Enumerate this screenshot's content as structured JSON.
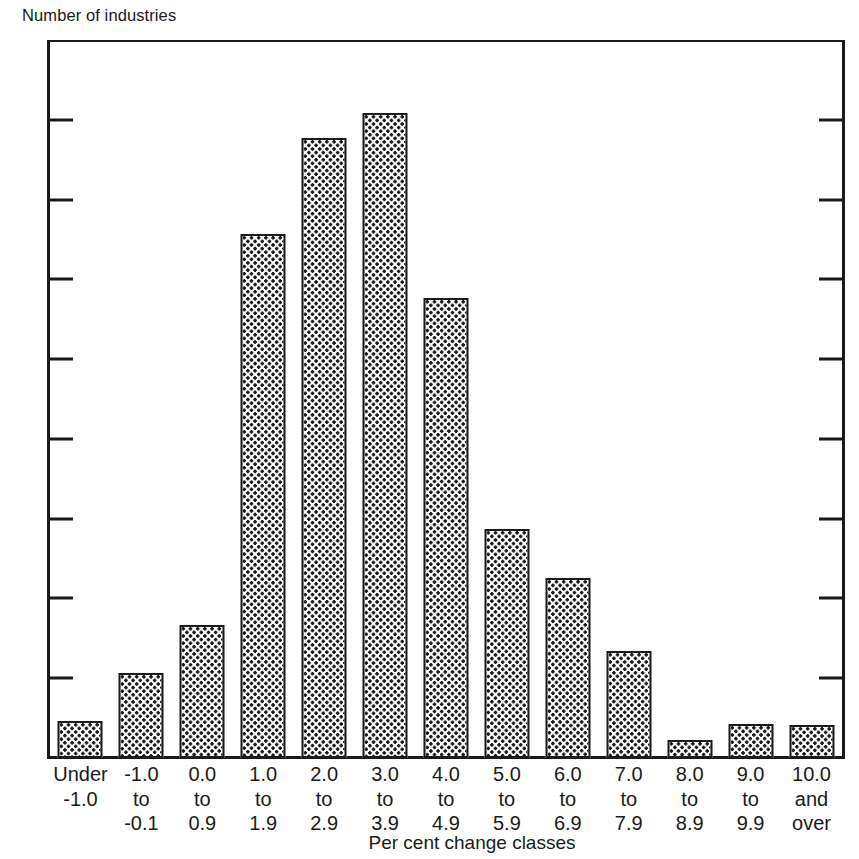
{
  "chart_data": {
    "type": "bar",
    "title": "",
    "xlabel": "Per cent change classes",
    "ylabel": "Number of industries",
    "ylim": [
      0,
      90
    ],
    "yticks": [
      0,
      10,
      20,
      30,
      40,
      50,
      60,
      70,
      80,
      90
    ],
    "grid": false,
    "legend": false,
    "categories": [
      "Under\n-1.0",
      "-1.0\nto\n-0.1",
      "0.0\nto\n0.9",
      "1.0\nto\n1.9",
      "2.0\nto\n2.9",
      "3.0\nto\n3.9",
      "4.0\nto\n4.9",
      "5.0\nto\n5.9",
      "6.0\nto\n6.9",
      "7.0\nto\n7.9",
      "8.0\nto\n8.9",
      "9.0\nto\n9.9",
      "10.0\nand\nover"
    ],
    "category_lines": [
      [
        "Under",
        "-1.0"
      ],
      [
        "-1.0",
        "to",
        "-0.1"
      ],
      [
        "0.0",
        "to",
        "0.9"
      ],
      [
        "1.0",
        "to",
        "1.9"
      ],
      [
        "2.0",
        "to",
        "2.9"
      ],
      [
        "3.0",
        "to",
        "3.9"
      ],
      [
        "4.0",
        "to",
        "4.9"
      ],
      [
        "5.0",
        "to",
        "5.9"
      ],
      [
        "6.0",
        "to",
        "6.9"
      ],
      [
        "7.0",
        "to",
        "7.9"
      ],
      [
        "8.0",
        "to",
        "8.9"
      ],
      [
        "9.0",
        "to",
        "9.9"
      ],
      [
        "10.0",
        "and",
        "over"
      ]
    ],
    "values": [
      4.7,
      10.7,
      16.7,
      65.7,
      77.7,
      80.8,
      57.6,
      28.7,
      22.6,
      13.4,
      2.2,
      4.3,
      4.2
    ],
    "bar_fill": "dotted-halftone",
    "bar_edge_color": "#1a1a1a",
    "bar_face_color": "#fbfbfb",
    "background_color": "#ffffff"
  },
  "axis": {
    "y_title": "Number of industries",
    "x_title": "Per cent change classes",
    "y_tick_labels": [
      "90",
      "80",
      "70",
      "60",
      "50",
      "40",
      "30",
      "20",
      "10",
      "0"
    ]
  }
}
